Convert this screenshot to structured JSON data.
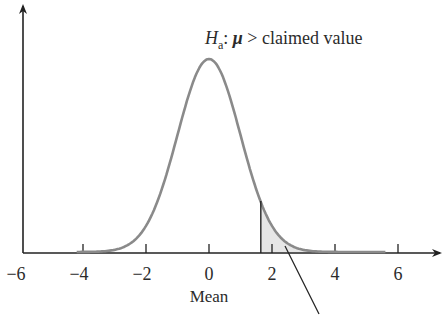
{
  "chart_data": {
    "type": "line",
    "title": "",
    "xlabel": "Mean",
    "ylabel": "",
    "xlim": [
      -6,
      7.4
    ],
    "ylim": [
      0,
      0.4
    ],
    "x_ticks": [
      -6,
      -4,
      -2,
      0,
      2,
      4,
      6
    ],
    "x_tick_labels": [
      "−6",
      "−4",
      "−2",
      "0",
      "2",
      "4",
      "6"
    ],
    "grid": false,
    "legend": null,
    "series": [
      {
        "name": "Standard normal density",
        "distribution": "normal",
        "mean": 0,
        "sd": 1,
        "x": [
          -4,
          -3,
          -2,
          -1,
          0,
          1,
          2,
          3,
          4
        ],
        "values": [
          0.0001,
          0.0044,
          0.054,
          0.242,
          0.399,
          0.242,
          0.054,
          0.0044,
          0.0001
        ]
      }
    ],
    "shaded_region": {
      "description": "Right-tail rejection region",
      "from": 1.645,
      "to": "+infinity"
    },
    "annotations": [
      {
        "text_main": "H",
        "text_sub": "a",
        "text_rest": ": μ > claimed value",
        "position": "above right of peak"
      }
    ]
  },
  "labels": {
    "hyp_main": "H",
    "hyp_sub": "a",
    "hyp_colon": ": ",
    "hyp_mu": "μ",
    "hyp_rest": " > claimed value",
    "xlabel": "Mean"
  },
  "colors": {
    "curve": "#8a8a8a",
    "axis": "#222222",
    "shade": "#e6e6e6",
    "text": "#2b2b2b"
  }
}
